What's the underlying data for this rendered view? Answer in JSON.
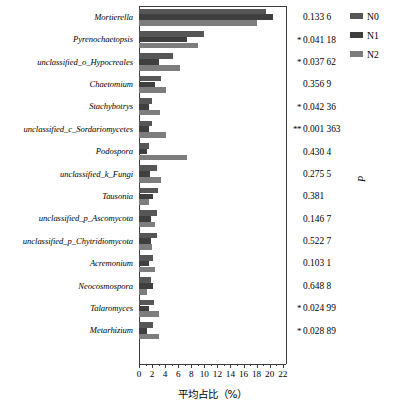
{
  "chart_data": {
    "type": "bar",
    "orientation": "horizontal",
    "title": "",
    "xlabel": "平均占比（%）",
    "ylabel": "",
    "right_axis_label": "P",
    "xlim": [
      0,
      22.5
    ],
    "xticks": [
      0,
      2,
      4,
      6,
      8,
      10,
      12,
      14,
      16,
      18,
      20,
      22
    ],
    "xticklabels": [
      "0",
      "2",
      "4",
      "6",
      "8",
      "10",
      "12",
      "14",
      "16",
      "18",
      "20",
      "22"
    ],
    "grid": false,
    "legend_position": "top-right",
    "legend": [
      "N0",
      "N1",
      "N2"
    ],
    "series": [
      {
        "name": "N0",
        "color": "#565656",
        "values": [
          19.5,
          10.0,
          5.2,
          3.3,
          2.0,
          2.0,
          1.5,
          2.7,
          2.9,
          2.8,
          2.8,
          2.1,
          1.9,
          2.3,
          2.1
        ]
      },
      {
        "name": "N1",
        "color": "#3f3f3f",
        "values": [
          20.5,
          7.4,
          3.1,
          2.5,
          1.6,
          1.6,
          1.3,
          1.7,
          2.2,
          1.9,
          1.9,
          1.6,
          2.1,
          1.5,
          1.3
        ]
      },
      {
        "name": "N2",
        "color": "#7d7d7d",
        "values": [
          18.0,
          9.0,
          6.2,
          4.1,
          3.2,
          4.2,
          7.4,
          3.3,
          1.5,
          2.4,
          2.0,
          2.4,
          1.3,
          3.0,
          3.0
        ]
      }
    ],
    "categories": [
      "Mortierella",
      "Pyrenochaetopsis",
      "unclassified_o_Hypocreales",
      "Chaetomium",
      "Stachybotrys",
      "unclassified_c_Sordariomycetes",
      "Podospora",
      "unclassified_k_Fungi",
      "Tausonia",
      "unclassified_p_Ascomycota",
      "unclassified_p_Chytridiomycota",
      "Acremonium",
      "Neocosmospora",
      "Talaromyces",
      "Metarhizium"
    ],
    "p_values": [
      {
        "stars": "",
        "value": "0.133 6"
      },
      {
        "stars": "*",
        "value": "0.041 18"
      },
      {
        "stars": "*",
        "value": "0.037 62"
      },
      {
        "stars": "",
        "value": "0.356 9"
      },
      {
        "stars": "*",
        "value": "0.042 36"
      },
      {
        "stars": "**",
        "value": "0.001 363"
      },
      {
        "stars": "",
        "value": "0.430 4"
      },
      {
        "stars": "",
        "value": "0.275 5"
      },
      {
        "stars": "",
        "value": "0.381"
      },
      {
        "stars": "",
        "value": "0.146 7"
      },
      {
        "stars": "",
        "value": "0.522 7"
      },
      {
        "stars": "",
        "value": "0.103 1"
      },
      {
        "stars": "",
        "value": "0.648 8"
      },
      {
        "stars": "*",
        "value": "0.024 99"
      },
      {
        "stars": "*",
        "value": "0.028 89"
      }
    ]
  },
  "colors": {
    "series_n0": "#565656",
    "series_n1": "#3f3f3f",
    "series_n2": "#7d7d7d",
    "axis": "#3a3a3a",
    "background": "#ffffff"
  }
}
